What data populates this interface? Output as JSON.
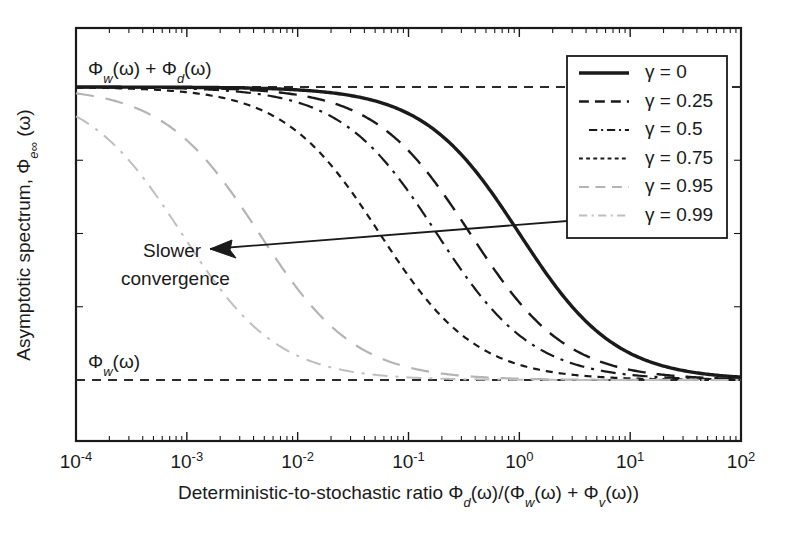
{
  "chart_data": {
    "type": "line",
    "title": "",
    "xlabel": "Deterministic-to-stochastic ratio Φ_d(ω)/(Φ_w(ω) + Φ_v(ω))",
    "ylabel": "Asymptotic spectrum, Φ_e∞(ω)",
    "xscale": "log",
    "xlim": [
      0.0001,
      100
    ],
    "ylim": [
      0,
      1
    ],
    "grid": false,
    "legend_position": "upper right",
    "x_tick_labels": [
      "10⁻⁴",
      "10⁻³",
      "10⁻²",
      "10⁻¹",
      "10⁰",
      "10¹",
      "10²"
    ],
    "x_tick_values": [
      0.0001,
      0.001,
      0.01,
      0.1,
      1,
      10,
      100
    ],
    "y_tick_labels": [],
    "asymptotes": [
      {
        "name": "upper-asymptote",
        "label": "Φ_w(ω) + Φ_d(ω)",
        "value": 1.0,
        "style": "dashed"
      },
      {
        "name": "lower-asymptote",
        "label": "Φ_w(ω)",
        "value": 0.0,
        "style": "dashed"
      }
    ],
    "annotations": [
      {
        "name": "slower-convergence",
        "text_line1": "Slower",
        "text_line2": "convergence",
        "arrow": "left"
      }
    ],
    "series": [
      {
        "name": "γ = 0",
        "gamma": 0,
        "style": "solid",
        "color": "#1a1a1a",
        "width": 3.4,
        "dash": "none",
        "x_half": 1.0,
        "comment": "transition centered near 10^0"
      },
      {
        "name": "γ = 0.25",
        "gamma": 0.25,
        "style": "long-dash",
        "color": "#1a1a1a",
        "width": 2.4,
        "dash": "18 11",
        "x_half": 0.36
      },
      {
        "name": "γ = 0.5",
        "gamma": 0.5,
        "style": "dash-dot",
        "color": "#1a1a1a",
        "width": 2.2,
        "dash": "15 7 3 7",
        "x_half": 0.18
      },
      {
        "name": "γ = 0.75",
        "gamma": 0.75,
        "style": "short-dash",
        "color": "#1a1a1a",
        "width": 2.2,
        "dash": "7 6",
        "x_half": 0.055
      },
      {
        "name": "γ = 0.95",
        "gamma": 0.95,
        "style": "long-dash-gray",
        "color": "#b4b4b4",
        "width": 2.2,
        "dash": "18 12",
        "x_half": 0.0045
      },
      {
        "name": "γ = 0.99",
        "gamma": 0.99,
        "style": "dash-dot-gray",
        "color": "#bfbfbf",
        "width": 2.0,
        "dash": "15 8 3 8",
        "x_half": 0.0009
      }
    ]
  },
  "legend": {
    "entries": [
      {
        "label": "γ = 0"
      },
      {
        "label": "γ = 0.25"
      },
      {
        "label": "γ = 0.5"
      },
      {
        "label": "γ = 0.75"
      },
      {
        "label": "γ = 0.95"
      },
      {
        "label": "γ = 0.99"
      }
    ]
  },
  "labels": {
    "upper_asymptote": "Φw(ω) + Φd(ω)",
    "lower_asymptote": "Φw(ω)",
    "annotation_line1": "Slower",
    "annotation_line2": "convergence",
    "y_axis": "Asymptotic spectrum,",
    "x_axis": "Deterministic-to-stochastic ratio"
  },
  "colors": {
    "foreground": "#1a1a1a",
    "gray_curve": "#b9b9b9",
    "background": "#ffffff"
  }
}
